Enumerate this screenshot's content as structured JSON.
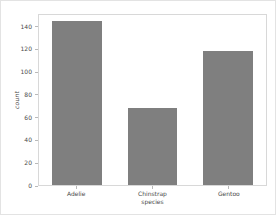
{
  "figure": {
    "background_color": "#ffffff",
    "border_color": "#e3e3e3",
    "spine_color": "#d8d8d8"
  },
  "chart_data": {
    "type": "bar",
    "title": "",
    "subtitle": "",
    "categories": [
      "Adelie",
      "Chinstrap",
      "Gentoo"
    ],
    "values": [
      146,
      68,
      119
    ],
    "xlabel": "species",
    "ylabel": "count",
    "ylim": [
      0,
      151
    ],
    "xlim": [
      -0.5,
      2.5
    ],
    "yticks": [
      0,
      20,
      40,
      60,
      80,
      100,
      120,
      140
    ],
    "ytick_labels": [
      "0",
      "20",
      "40",
      "60",
      "80",
      "100",
      "120",
      "140"
    ],
    "xtick_labels": [
      "Adelie",
      "Chinstrap",
      "Gentoo"
    ],
    "bar_color": "#7f7f7f",
    "bar_width_fraction": 0.66,
    "grid": false,
    "legend": null,
    "legend_position": "none",
    "annotations": []
  }
}
